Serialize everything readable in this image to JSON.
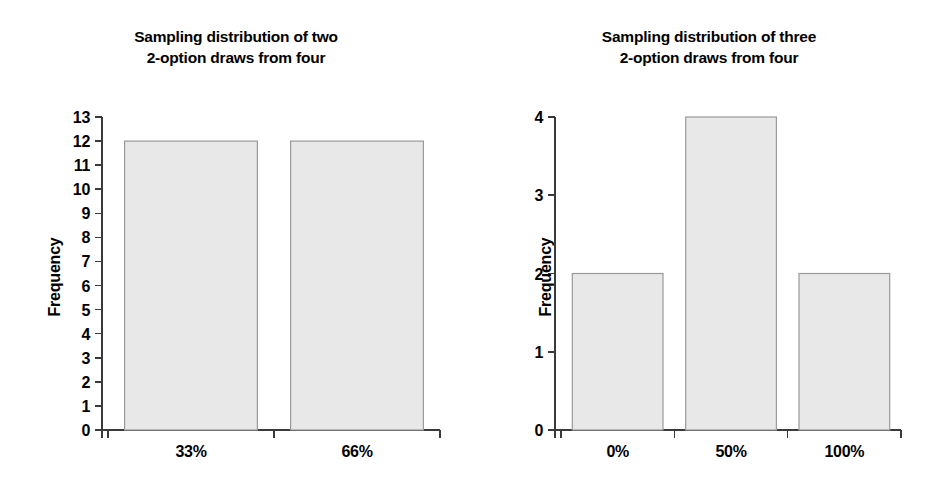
{
  "figure": {
    "background_color": "#ffffff",
    "bar_fill_color": "#e8e8e8",
    "bar_border_color": "#9a9a9a",
    "axis_color": "#3a3a3a"
  },
  "panels": [
    {
      "id": "left",
      "title_line1": "Sampling distribution of two",
      "title_line2": "2-option draws from four",
      "ylabel": "Frequency",
      "ticks": [
        "0",
        "1",
        "2",
        "3",
        "4",
        "5",
        "6",
        "7",
        "8",
        "9",
        "10",
        "11",
        "12",
        "13"
      ],
      "categories": [
        "33%",
        "66%"
      ],
      "values": [
        12,
        12
      ]
    },
    {
      "id": "right",
      "title_line1": "Sampling distribution of three",
      "title_line2": "2-option draws from four",
      "ylabel": "Frequency",
      "ticks": [
        "0",
        "1",
        "2",
        "3",
        "4"
      ],
      "categories": [
        "0%",
        "50%",
        "100%"
      ],
      "values": [
        2,
        4,
        2
      ]
    }
  ],
  "chart_data": [
    {
      "type": "bar",
      "title": "Sampling distribution of two 2-option draws from four",
      "categories": [
        "33%",
        "66%"
      ],
      "values": [
        12,
        12
      ],
      "xlabel": "",
      "ylabel": "Frequency",
      "ylim": [
        0,
        13
      ],
      "ytick_step": 1,
      "yticks": [
        0,
        1,
        2,
        3,
        4,
        5,
        6,
        7,
        8,
        9,
        10,
        11,
        12,
        13
      ],
      "grid": false,
      "legend": false,
      "position": "left"
    },
    {
      "type": "bar",
      "title": "Sampling distribution of three 2-option draws from four",
      "categories": [
        "0%",
        "50%",
        "100%"
      ],
      "values": [
        2,
        4,
        2
      ],
      "xlabel": "",
      "ylabel": "Frequency",
      "ylim": [
        0,
        4
      ],
      "ytick_step": 1,
      "yticks": [
        0,
        1,
        2,
        3,
        4
      ],
      "grid": false,
      "legend": false,
      "position": "right"
    }
  ]
}
